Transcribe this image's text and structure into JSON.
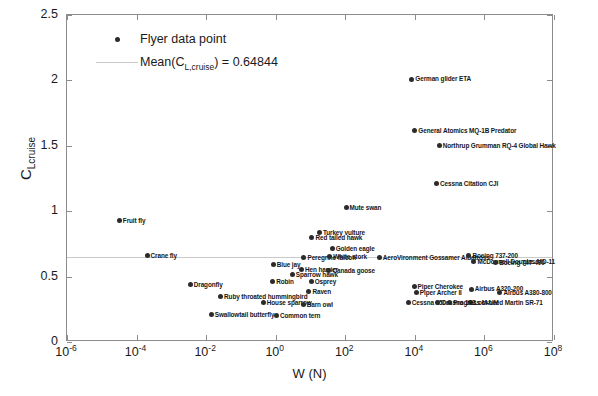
{
  "chart_data": {
    "type": "scatter",
    "title": "",
    "xlabel": "W (N)",
    "ylabel": "C_Lcruise",
    "ylabel_main": "C",
    "ylabel_sub": "Lcruise",
    "xscale": "log",
    "yscale": "linear",
    "xlim": [
      1e-06,
      100000000.0
    ],
    "ylim": [
      0,
      2.5
    ],
    "grid": false,
    "xticks": [
      {
        "value": 1e-06,
        "mantissa": "10",
        "exp": "-6"
      },
      {
        "value": 0.0001,
        "mantissa": "10",
        "exp": "-4"
      },
      {
        "value": 0.01,
        "mantissa": "10",
        "exp": "-2"
      },
      {
        "value": 1.0,
        "mantissa": "10",
        "exp": "0"
      },
      {
        "value": 100.0,
        "mantissa": "10",
        "exp": "2"
      },
      {
        "value": 10000.0,
        "mantissa": "10",
        "exp": "4"
      },
      {
        "value": 1000000.0,
        "mantissa": "10",
        "exp": "6"
      },
      {
        "value": 100000000.0,
        "mantissa": "10",
        "exp": "8"
      }
    ],
    "yticks": [
      "0",
      "0.5",
      "1",
      "1.5",
      "2",
      "2.5"
    ],
    "mean_value": 0.64844,
    "legend": {
      "position": "top-left",
      "entries": [
        {
          "label": "Flyer data point",
          "marker": "dot",
          "color": "#2b2b2b"
        },
        {
          "label_prefix": "Mean(C",
          "label_sub": "L,cruise",
          "label_suffix": ") = 0.64844",
          "marker": "line",
          "color": "#c9c9c9"
        }
      ]
    },
    "series": [
      {
        "name": "Flyer data point",
        "color": "#2b2b2b",
        "points": [
          {
            "label": "Fruit fly",
            "w": 3.2e-05,
            "cl": 0.93
          },
          {
            "label": "Crane fly",
            "w": 0.0002,
            "cl": 0.66
          },
          {
            "label": "Dragonfly",
            "w": 0.0035,
            "cl": 0.44
          },
          {
            "label": "Ruby throated hummingbird",
            "w": 0.026,
            "cl": 0.345
          },
          {
            "label": "Swallowtail butterfly",
            "w": 0.014,
            "cl": 0.21
          },
          {
            "label": "Blue jay",
            "w": 0.85,
            "cl": 0.59
          },
          {
            "label": "Robin",
            "w": 0.82,
            "cl": 0.46
          },
          {
            "label": "House sparrow",
            "w": 0.44,
            "cl": 0.3
          },
          {
            "label": "Common tern",
            "w": 1.05,
            "cl": 0.205
          },
          {
            "label": "Osprey",
            "w": 10.5,
            "cl": 0.46
          },
          {
            "label": "Raven",
            "w": 9.0,
            "cl": 0.385
          },
          {
            "label": "Barn owl",
            "w": 6.2,
            "cl": 0.285
          },
          {
            "label": "Hen harrier",
            "w": 5.5,
            "cl": 0.555
          },
          {
            "label": "Sparrow hawk",
            "w": 3.0,
            "cl": 0.515
          },
          {
            "label": "Peregrine falcon",
            "w": 6.5,
            "cl": 0.645
          },
          {
            "label": "Canada goose",
            "w": 34.0,
            "cl": 0.545
          },
          {
            "label": "Red tailed hawk",
            "w": 11.0,
            "cl": 0.8
          },
          {
            "label": "Turkey vulture",
            "w": 18.0,
            "cl": 0.835
          },
          {
            "label": "Golden eagle",
            "w": 42.0,
            "cl": 0.715
          },
          {
            "label": "Mute swan",
            "w": 105.0,
            "cl": 1.03
          },
          {
            "label": "White stork",
            "w": 36.0,
            "cl": 0.655
          },
          {
            "label": "AeroVironment Gossamer Albatross",
            "w": 950.0,
            "cl": 0.645
          },
          {
            "label": "German glider ETA",
            "w": 8200.0,
            "cl": 2.01
          },
          {
            "label": "General Atomics MQ-1B Predator",
            "w": 10000.0,
            "cl": 1.62
          },
          {
            "label": "Northrup Grumman RQ-4 Global Hawk",
            "w": 50000.0,
            "cl": 1.5
          },
          {
            "label": "Cessna Citation CJI",
            "w": 42000.0,
            "cl": 1.21
          },
          {
            "label": "Boeing 737-200",
            "w": 360000.0,
            "cl": 0.66
          },
          {
            "label": "McDonnell Douglas MD-11",
            "w": 500000.0,
            "cl": 0.615
          },
          {
            "label": "Boeing 747-400",
            "w": 2100000.0,
            "cl": 0.605
          },
          {
            "label": "Piper Cherokee",
            "w": 9500.0,
            "cl": 0.425
          },
          {
            "label": "Piper Archer II",
            "w": 11000.0,
            "cl": 0.375
          },
          {
            "label": "Cessna 150",
            "w": 6500.0,
            "cl": 0.305
          },
          {
            "label": "Cessna 172",
            "w": 45000.0,
            "cl": 0.305
          },
          {
            "label": "Airbus A320-200",
            "w": 420000.0,
            "cl": 0.405
          },
          {
            "label": "Airbus A380-800",
            "w": 2800000.0,
            "cl": 0.375
          },
          {
            "label": "Lockheed Martin SR-71",
            "w": 400000.0,
            "cl": 0.305
          },
          {
            "label": "Progress M-UM",
            "w": 100000.0,
            "cl": 0.305
          }
        ]
      }
    ]
  }
}
